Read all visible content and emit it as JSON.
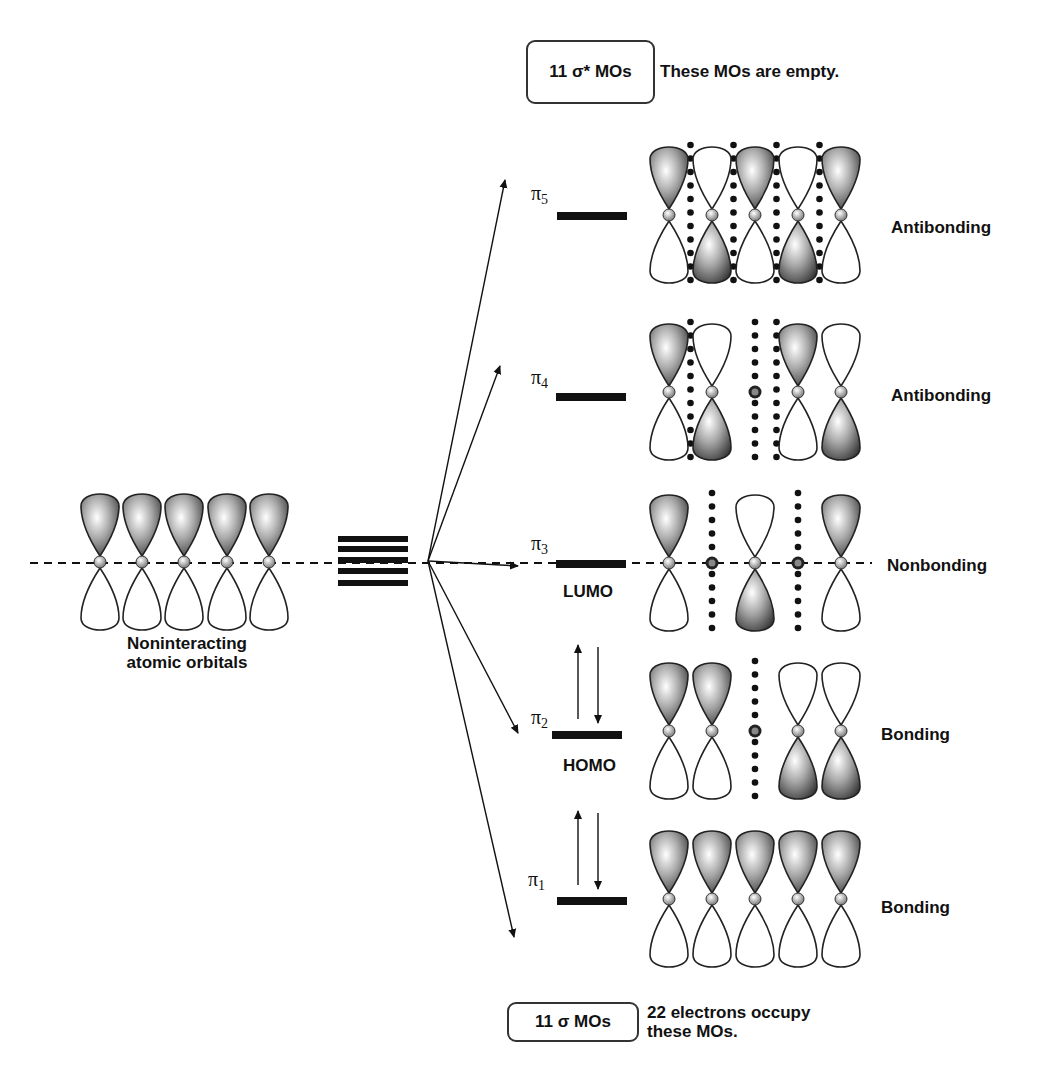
{
  "diagram": {
    "top_box": {
      "label": "11 σ*  MOs",
      "note": "These MOs are empty."
    },
    "bottom_box": {
      "label": "11 σ  MOs",
      "note_line1": "22 electrons occupy",
      "note_line2": "these MOs."
    },
    "atomic_orbitals": {
      "label_line1": "Noninteracting",
      "label_line2": "atomic orbitals",
      "count": 5
    },
    "levels": [
      {
        "id": "pi5",
        "symbol": "π",
        "index": "5",
        "character": "Antibonding",
        "tag": "",
        "electrons": 0,
        "phases": [
          "+",
          "-",
          "+",
          "-",
          "+"
        ],
        "nodes": [
          1,
          2,
          3,
          4
        ],
        "node_atoms": []
      },
      {
        "id": "pi4",
        "symbol": "π",
        "index": "4",
        "character": "Antibonding",
        "tag": "",
        "electrons": 0,
        "phases": [
          "+",
          "-",
          "0",
          "+",
          "-"
        ],
        "nodes": [
          1,
          3
        ],
        "node_atoms": [
          2
        ]
      },
      {
        "id": "pi3",
        "symbol": "π",
        "index": "3",
        "character": "Nonbonding",
        "tag": "LUMO",
        "electrons": 0,
        "phases": [
          "+",
          "0",
          "-",
          "0",
          "+"
        ],
        "nodes": [],
        "node_atoms": [
          1,
          3
        ]
      },
      {
        "id": "pi2",
        "symbol": "π",
        "index": "2",
        "character": "Bonding",
        "tag": "HOMO",
        "electrons": 2,
        "phases": [
          "+",
          "+",
          "0",
          "-",
          "-"
        ],
        "nodes": [],
        "node_atoms": [
          2
        ]
      },
      {
        "id": "pi1",
        "symbol": "π",
        "index": "1",
        "character": "Bonding",
        "tag": "",
        "electrons": 2,
        "phases": [
          "+",
          "+",
          "+",
          "+",
          "+"
        ],
        "nodes": [],
        "node_atoms": []
      }
    ],
    "colors": {
      "ink": "#111111",
      "lobe_dark": "#3a3a3a",
      "lobe_light": "#f2f2f2",
      "atom": "#9a9a9a"
    }
  }
}
